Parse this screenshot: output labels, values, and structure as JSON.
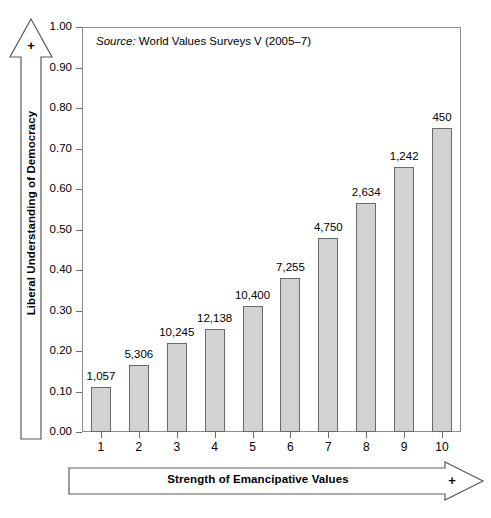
{
  "figure": {
    "source_note_prefix": "Source",
    "source_note": "Source: World Values Surveys V (2005–7)",
    "source_label": "Source:",
    "source_text": " World Values Surveys V (2005–7)",
    "y_axis_arrow_plus": "+",
    "x_axis_arrow_plus": "+",
    "bar_fill_color": "#d2d2d2",
    "bar_stroke_color": "#6a6a6a",
    "frame_color": "#8c8c8c"
  },
  "chart_data": {
    "type": "bar",
    "title": "",
    "subtitle": "",
    "annotations": [
      "Source: World Values Surveys V (2005–7)"
    ],
    "xlabel": "Strength of Emancipative Values",
    "ylabel": "Liberal Understanding of Democracy",
    "xlim": [
      0.5,
      10.5
    ],
    "ylim": [
      0.0,
      1.0
    ],
    "grid": false,
    "legend": null,
    "categories": [
      "1",
      "2",
      "3",
      "4",
      "5",
      "6",
      "7",
      "8",
      "9",
      "10"
    ],
    "values": [
      0.11,
      0.165,
      0.22,
      0.255,
      0.31,
      0.38,
      0.48,
      0.565,
      0.655,
      0.75
    ],
    "point_labels": [
      "1,057",
      "5,306",
      "10,245",
      "12,138",
      "10,400",
      "7,255",
      "4,750",
      "2,634",
      "1,242",
      "450"
    ],
    "ytick_labels": [
      "0.00",
      "0.10",
      "0.20",
      "0.30",
      "0.40",
      "0.50",
      "0.60",
      "0.70",
      "0.80",
      "0.90",
      "1.00"
    ],
    "ytick_values": [
      0.0,
      0.1,
      0.2,
      0.3,
      0.4,
      0.5,
      0.6,
      0.7,
      0.8,
      0.9,
      1.0
    ],
    "xtick_labels": [
      "1",
      "2",
      "3",
      "4",
      "5",
      "6",
      "7",
      "8",
      "9",
      "10"
    ]
  }
}
